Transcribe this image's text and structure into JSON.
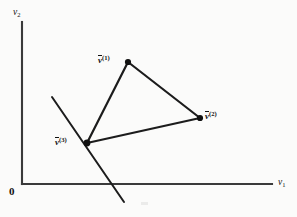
{
  "figure": {
    "background_color": "#fbfbfa",
    "ink_color": "#111111",
    "axis_color": "#3a3a3a"
  },
  "axes": {
    "origin_label": "0",
    "x_axis": {
      "label_var": "v",
      "label_sub": "1",
      "from_x": 22,
      "from_y": 184,
      "to_x": 272,
      "to_y": 184,
      "label_left": 278,
      "label_top": 178
    },
    "y_axis": {
      "label_var": "v",
      "label_sub": "2",
      "from_x": 22,
      "from_y": 22,
      "to_x": 22,
      "to_y": 184,
      "label_left": 13,
      "label_top": 8
    },
    "origin_left": 9,
    "origin_top": 186
  },
  "chart_data": {
    "type": "scatter",
    "title": "",
    "xlabel": "v1",
    "ylabel": "v2",
    "grid": false,
    "legend": null,
    "points": [
      {
        "name": "v(1)",
        "label_var": "v",
        "label_sup": "(1)",
        "x": 128,
        "y": 62,
        "label_left": 98,
        "label_top": 55,
        "label_align": "right"
      },
      {
        "name": "v(2)",
        "label_var": "v",
        "label_sup": "(2)",
        "x": 200,
        "y": 118,
        "label_left": 205,
        "label_top": 111,
        "label_align": "left"
      },
      {
        "name": "v(3)",
        "label_var": "v",
        "label_sup": "(3)",
        "x": 87,
        "y": 143,
        "label_left": 55,
        "label_top": 137,
        "label_align": "right"
      }
    ],
    "edges": [
      {
        "name": "edge-v1-v2",
        "x1": 128,
        "y1": 62,
        "x2": 200,
        "y2": 118
      },
      {
        "name": "edge-v2-v3",
        "x1": 200,
        "y1": 118,
        "x2": 87,
        "y2": 143
      },
      {
        "name": "edge-v3-v1",
        "x1": 87,
        "y1": 143,
        "x2": 128,
        "y2": 62
      }
    ],
    "cross_line": {
      "name": "line-through-v3",
      "x1": 52,
      "y1": 97,
      "x2": 124,
      "y2": 202
    }
  }
}
